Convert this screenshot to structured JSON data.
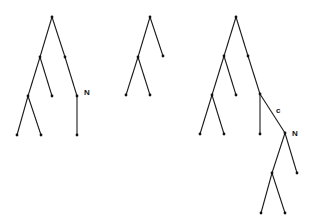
{
  "diagram": {
    "type": "tree-diagram",
    "trees": [
      {
        "id": "tree-1",
        "nodes": [
          {
            "id": "r",
            "x": 52,
            "y": 17
          },
          {
            "id": "a",
            "x": 40,
            "y": 57
          },
          {
            "id": "b",
            "x": 65,
            "y": 57
          },
          {
            "id": "c",
            "x": 28,
            "y": 96
          },
          {
            "id": "d",
            "x": 52,
            "y": 96
          },
          {
            "id": "e",
            "x": 77,
            "y": 96
          },
          {
            "id": "f",
            "x": 17,
            "y": 135
          },
          {
            "id": "g",
            "x": 41,
            "y": 135
          },
          {
            "id": "h",
            "x": 77,
            "y": 135
          }
        ],
        "edges": [
          [
            "r",
            "a"
          ],
          [
            "r",
            "b"
          ],
          [
            "b",
            "e"
          ],
          [
            "a",
            "c"
          ],
          [
            "a",
            "d"
          ],
          [
            "c",
            "f"
          ],
          [
            "c",
            "g"
          ],
          [
            "e",
            "h"
          ]
        ],
        "labels": [
          {
            "text": "N",
            "x": 84,
            "y": 95
          }
        ]
      },
      {
        "id": "tree-2",
        "nodes": [
          {
            "id": "r",
            "x": 150,
            "y": 17
          },
          {
            "id": "a",
            "x": 138,
            "y": 57
          },
          {
            "id": "b",
            "x": 163,
            "y": 56
          },
          {
            "id": "c",
            "x": 126,
            "y": 95
          },
          {
            "id": "d",
            "x": 150,
            "y": 95
          }
        ],
        "edges": [
          [
            "r",
            "a"
          ],
          [
            "r",
            "b"
          ],
          [
            "a",
            "c"
          ],
          [
            "a",
            "d"
          ]
        ],
        "labels": []
      },
      {
        "id": "tree-3",
        "nodes": [
          {
            "id": "r",
            "x": 236,
            "y": 17
          },
          {
            "id": "a",
            "x": 224,
            "y": 56
          },
          {
            "id": "b",
            "x": 248,
            "y": 56
          },
          {
            "id": "c",
            "x": 212,
            "y": 95
          },
          {
            "id": "d",
            "x": 236,
            "y": 95
          },
          {
            "id": "e",
            "x": 260,
            "y": 94
          },
          {
            "id": "f",
            "x": 200,
            "y": 134
          },
          {
            "id": "g",
            "x": 224,
            "y": 134
          },
          {
            "id": "h",
            "x": 260,
            "y": 134
          },
          {
            "id": "n",
            "x": 285,
            "y": 133
          },
          {
            "id": "i",
            "x": 272,
            "y": 173
          },
          {
            "id": "j",
            "x": 297,
            "y": 173
          },
          {
            "id": "k",
            "x": 261,
            "y": 213
          },
          {
            "id": "l",
            "x": 285,
            "y": 213
          }
        ],
        "edges": [
          [
            "r",
            "a"
          ],
          [
            "r",
            "b"
          ],
          [
            "b",
            "e"
          ],
          [
            "a",
            "c"
          ],
          [
            "a",
            "d"
          ],
          [
            "c",
            "f"
          ],
          [
            "c",
            "g"
          ],
          [
            "e",
            "h"
          ],
          [
            "e",
            "n"
          ],
          [
            "n",
            "i"
          ],
          [
            "n",
            "j"
          ],
          [
            "i",
            "k"
          ],
          [
            "i",
            "l"
          ]
        ],
        "labels": [
          {
            "text": "c",
            "x": 276,
            "y": 113
          },
          {
            "text": "N",
            "x": 292,
            "y": 136
          }
        ]
      }
    ]
  }
}
